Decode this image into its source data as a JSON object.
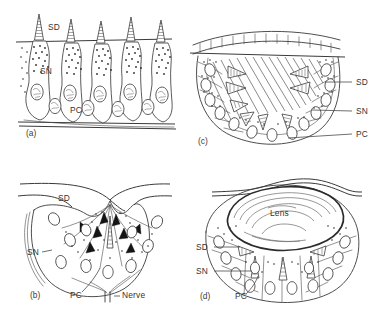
{
  "figure": {
    "background_color": "#ffffff",
    "ink_color": "#3a3a3a",
    "label_color": "#333333",
    "width": 380,
    "height": 315
  },
  "abbreviations": {
    "sd": "SD",
    "sn": "SN",
    "pc": "PC",
    "nerve": "Nerve",
    "lens": "Lens"
  },
  "panels": [
    {
      "key": "a",
      "caption": "(a)",
      "description": "flat pigment spot",
      "labels": [
        {
          "name": "sd",
          "text": "SD",
          "x": 48,
          "y": 30
        },
        {
          "name": "sn",
          "text": "SN",
          "x": 40,
          "y": 74
        },
        {
          "name": "pc",
          "text": "PC",
          "x": 70,
          "y": 113
        }
      ],
      "caption_pos": {
        "x": 26,
        "y": 136
      }
    },
    {
      "key": "b",
      "caption": "(b)",
      "description": "pigment cup eye with nerve",
      "labels": [
        {
          "name": "sd",
          "text": "SD",
          "x": 58,
          "y": 201
        },
        {
          "name": "sn",
          "text": "SN",
          "x": 27,
          "y": 255
        },
        {
          "name": "pc",
          "text": "PC",
          "x": 70,
          "y": 298
        },
        {
          "name": "nerve",
          "text": "Nerve",
          "x": 122,
          "y": 298
        }
      ],
      "caption_pos": {
        "x": 30,
        "y": 298
      }
    },
    {
      "key": "c",
      "caption": "(c)",
      "description": "cup eye filled with vitreous body, covered by cornea",
      "labels": [
        {
          "name": "sd",
          "text": "SD",
          "x": 356,
          "y": 85
        },
        {
          "name": "sn",
          "text": "SN",
          "x": 356,
          "y": 114
        },
        {
          "name": "pc",
          "text": "PC",
          "x": 356,
          "y": 137
        }
      ],
      "caption_pos": {
        "x": 198,
        "y": 144
      }
    },
    {
      "key": "d",
      "caption": "(d)",
      "description": "lens eye",
      "labels": [
        {
          "name": "sd",
          "text": "SD",
          "x": 196,
          "y": 250
        },
        {
          "name": "sn",
          "text": "SN",
          "x": 196,
          "y": 274
        },
        {
          "name": "pc",
          "text": "PC",
          "x": 235,
          "y": 299
        },
        {
          "name": "lens",
          "text": "Lens",
          "x": 285,
          "y": 213
        }
      ],
      "caption_pos": {
        "x": 200,
        "y": 299
      }
    }
  ]
}
